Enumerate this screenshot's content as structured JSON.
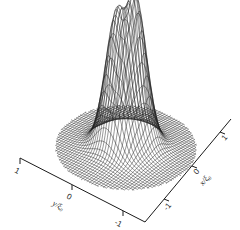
{
  "chart_data": {
    "type": "surface3d",
    "style": "wireframe",
    "title": "",
    "xlabel": "x/ξ₀",
    "ylabel": "y/ξ₀",
    "zlabel": "",
    "x_ticks": [
      "-1",
      "0",
      "1"
    ],
    "y_ticks": [
      "1",
      "0",
      "-1"
    ],
    "xlim": [
      -1,
      1
    ],
    "ylim": [
      -1,
      1
    ],
    "domain_shape": "disk",
    "peaks": [
      {
        "label": "left peak",
        "x": -0.15,
        "y": 0.05,
        "relative_height": 0.92
      },
      {
        "label": "right peak",
        "x": 0.15,
        "y": -0.05,
        "relative_height": 1.0
      }
    ],
    "grid": false,
    "legend": null,
    "colors": {
      "line": "#1a1a1a",
      "background": "#ffffff"
    }
  },
  "axes": {
    "y_axis": {
      "label": "y/ξ₀",
      "ticks": [
        {
          "value": "1"
        },
        {
          "value": "0"
        },
        {
          "value": "-1"
        }
      ]
    },
    "x_axis": {
      "label": "x/ξ₀",
      "ticks": [
        {
          "value": "-1"
        },
        {
          "value": "0"
        },
        {
          "value": "1"
        }
      ]
    }
  }
}
